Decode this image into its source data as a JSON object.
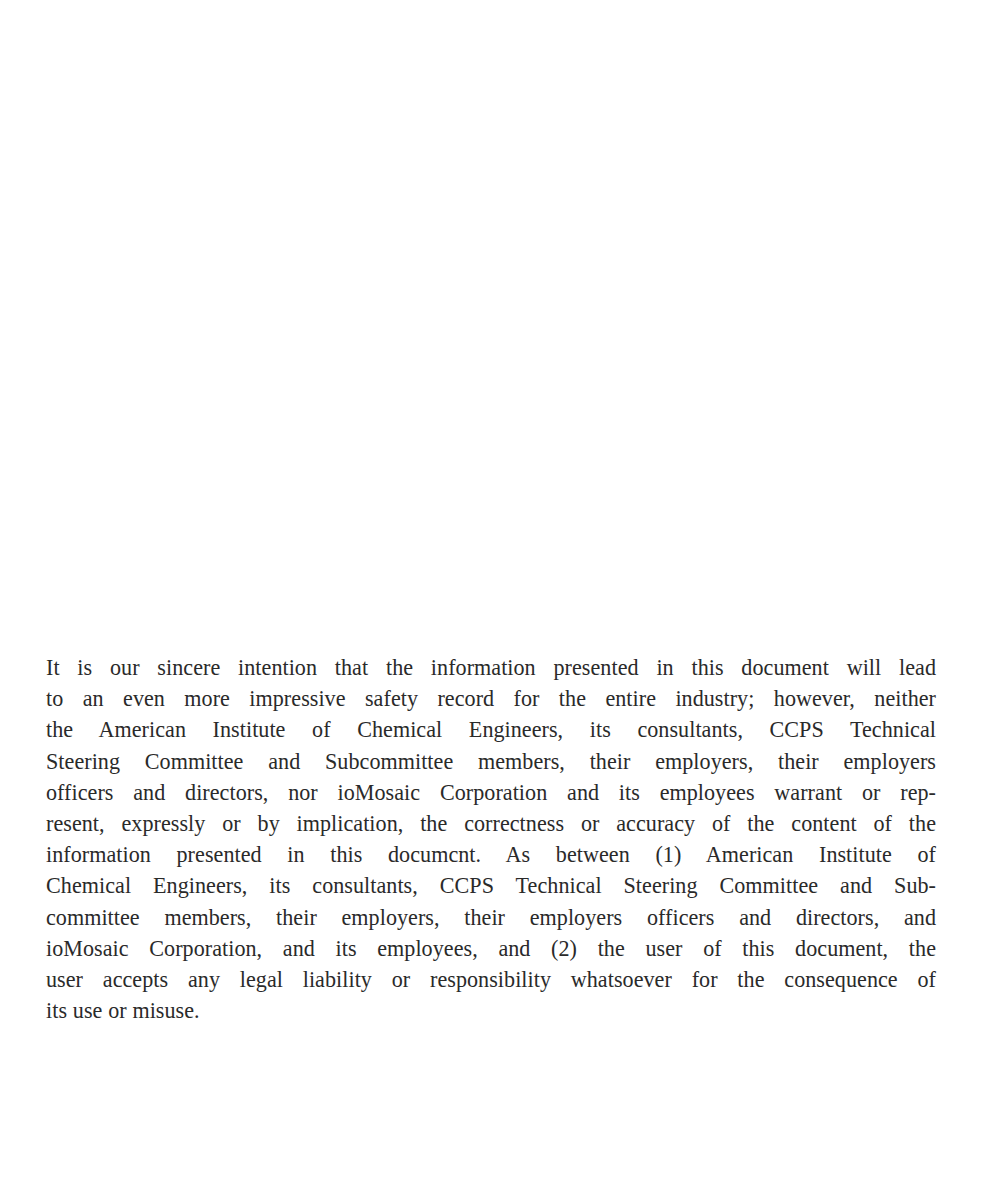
{
  "page": {
    "background_color": "#ffffff",
    "text_color": "#2a2a2a",
    "width": 1000,
    "height": 1184
  },
  "document": {
    "type": "scanned-page",
    "body_block": {
      "name": "disclaimer-paragraph",
      "alignment": "justified",
      "full_text": "It is our sincere intention that the information presented in this document will lead to an even more impressive safety record for the entire industry; however, neither the American Institute of Chemical Engineers, its consultants, CCPS Technical Steering Committee and Subcommittee members, their employers, their employers officers and directors, nor ioMosaic Corporation and its employees warrant or represent, expressly or by implication, the correctness or accuracy of the content of the information presented in this documcnt. As between (1) American Institute of Chemical Engineers, its consultants, CCPS Technical Steering Committee and Subcommittee members, their employers, their employers officers and directors, and ioMosaic Corporation, and its employees, and (2) the user of this document, the user accepts any legal liability or responsibility whatsoever for the consequence of its use or misuse.",
      "lines": [
        "It is our sincere intention that the information presented in this document will lead",
        "to an even more impressive safety record for the entire industry; however, neither",
        "the American Institute of Chemical Engineers, its consultants, CCPS Technical",
        "Steering Committee and Subcommittee members, their employers, their employers",
        "officers and directors, nor ioMosaic Corporation and its employees warrant or rep-",
        "resent, expressly or by implication, the correctness or accuracy of the content of the",
        "information presented in this documcnt. As between (1) American Institute of",
        "Chemical Engineers, its consultants, CCPS Technical Steering Committee and Sub-",
        "committee members, their employers, their employers officers and directors, and",
        "ioMosaic Corporation, and its employees, and (2) the user of this document, the",
        "user accepts any legal liability or responsibility whatsoever for the consequence of",
        "its use or misuse."
      ]
    }
  }
}
